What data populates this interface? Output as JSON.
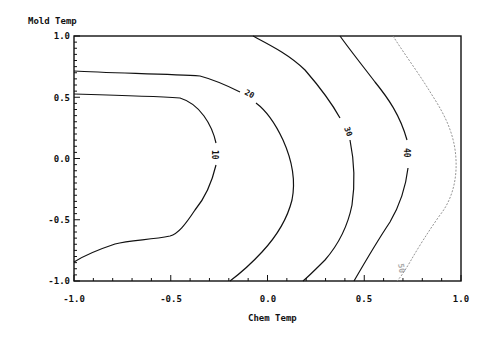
{
  "chart_data": {
    "type": "contour",
    "title": "",
    "xlabel": "Chem Temp",
    "ylabel": "Mold Temp",
    "xlim": [
      -1.0,
      1.0
    ],
    "ylim": [
      -1.0,
      1.0
    ],
    "x_ticks": [
      "-1.0",
      "-0.5",
      "0.0",
      "0.5",
      "1.0"
    ],
    "y_ticks": [
      "1.0",
      "0.5",
      "0.0",
      "-0.5",
      "-1.0"
    ],
    "grid": false,
    "legend": null,
    "contour_levels": [
      {
        "level": 10,
        "label": "10",
        "points": [
          [
            -1.0,
            0.29
          ],
          [
            -0.63,
            0.27
          ],
          [
            -0.35,
            0.19
          ],
          [
            -0.27,
            -0.04
          ],
          [
            -0.27,
            -0.16
          ],
          [
            -0.33,
            -0.42
          ],
          [
            -0.48,
            -0.64
          ],
          [
            -0.77,
            -0.66
          ],
          [
            -1.0,
            -0.84
          ]
        ]
      },
      {
        "level": 20,
        "label": "20",
        "points": [
          [
            -1.0,
            0.72
          ],
          [
            -0.71,
            0.69
          ],
          [
            -0.35,
            0.67
          ],
          [
            -0.14,
            0.52
          ],
          [
            0.04,
            0.33
          ],
          [
            0.15,
            -0.16
          ],
          [
            0.06,
            -0.57
          ],
          [
            -0.19,
            -1.0
          ]
        ]
      },
      {
        "level": 30,
        "label": "30",
        "points": [
          [
            -0.07,
            1.0
          ],
          [
            0.17,
            0.8
          ],
          [
            0.37,
            0.4
          ],
          [
            0.45,
            0.08
          ],
          [
            0.45,
            -0.33
          ],
          [
            0.32,
            -0.73
          ],
          [
            0.18,
            -1.0
          ]
        ]
      },
      {
        "level": 40,
        "label": "40",
        "points": [
          [
            0.37,
            1.0
          ],
          [
            0.58,
            0.64
          ],
          [
            0.71,
            0.11
          ],
          [
            0.71,
            -0.14
          ],
          [
            0.63,
            -0.51
          ],
          [
            0.45,
            -1.0
          ]
        ]
      },
      {
        "level": 50,
        "label": "50",
        "points": [
          [
            0.65,
            1.0
          ],
          [
            0.84,
            0.56
          ],
          [
            0.97,
            0.23
          ],
          [
            0.97,
            -0.18
          ],
          [
            0.89,
            -0.42
          ],
          [
            0.74,
            -0.83
          ],
          [
            0.67,
            -1.0
          ]
        ]
      }
    ],
    "contour_labels_text": [
      "10",
      "20",
      "30",
      "40",
      "50"
    ]
  }
}
